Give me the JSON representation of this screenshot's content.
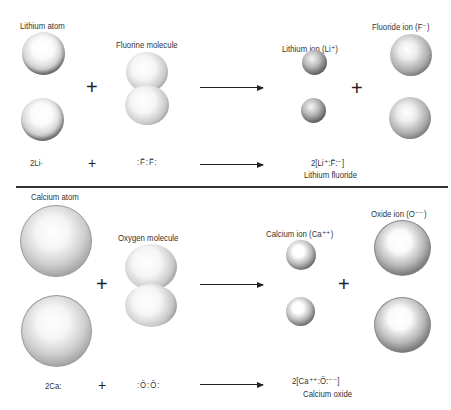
{
  "top_reaction": {
    "labels": {
      "reactant1": "Lithium atom",
      "reactant2": "Fluorine molecule",
      "product1": "Lithium ion (Li⁺)",
      "product2": "Fluoride ion (F⁻)"
    },
    "equation": {
      "reactant1": "2Li·",
      "plus1": "+",
      "reactant2": ":F̈:F̈:",
      "product": "2[Li⁺:F̈:⁻]",
      "product_name": "Lithium fluoride"
    },
    "plus_symbol": "+"
  },
  "bottom_reaction": {
    "labels": {
      "reactant1": "Calcium atom",
      "reactant2": "Oxygen molecule",
      "product1": "Calcium ion (Ca⁺⁺)",
      "product2": "Oxide ion (O⁻⁻)"
    },
    "equation": {
      "reactant1": "2Ca:",
      "plus1": "+",
      "reactant2": ":Ö:Ö:",
      "product": "2[Ca⁺⁺:Ö:⁻⁻]",
      "product_name": "Calcium oxide"
    },
    "plus_symbol": "+"
  }
}
